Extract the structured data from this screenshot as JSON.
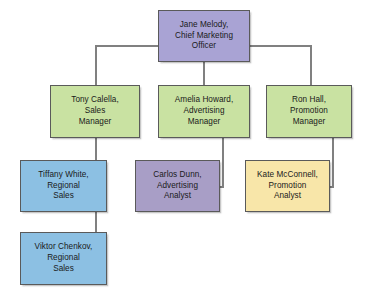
{
  "diagram": {
    "type": "organization-chart",
    "canvas": {
      "width": 376,
      "height": 302,
      "background": "#ffffff"
    },
    "connector_color": "#808080",
    "connector_width": 2,
    "palette": {
      "executive_purple": "#a9a3d4",
      "manager_green": "#c9e2a2",
      "regional_blue": "#8cc0e3",
      "analyst_purple": "#a89ec6",
      "analyst_yellow": "#f8e6a9",
      "border": "#5a5a5a"
    },
    "nodes": [
      {
        "id": "jane-melody",
        "name": "Jane Melody",
        "role": "Chief Marketing Officer",
        "lines": [
          "Jane Melody,",
          "Chief Marketing",
          "Officer"
        ],
        "level": 1,
        "fill": "#a9a3d4",
        "x": 158,
        "y": 10,
        "w": 92,
        "h": 52
      },
      {
        "id": "tony-calella",
        "name": "Tony Calella",
        "role": "Sales Manager",
        "lines": [
          "Tony Calella,",
          "Sales",
          "Manager"
        ],
        "level": 2,
        "fill": "#c9e2a2",
        "x": 50,
        "y": 85,
        "w": 90,
        "h": 53
      },
      {
        "id": "amelia-howard",
        "name": "Amelia Howard",
        "role": "Advertising Manager",
        "lines": [
          "Amelia Howard,",
          "Advertising",
          "Manager"
        ],
        "level": 2,
        "fill": "#c9e2a2",
        "x": 158,
        "y": 85,
        "w": 92,
        "h": 53
      },
      {
        "id": "ron-hall",
        "name": "Ron Hall",
        "role": "Promotion Manager",
        "lines": [
          "Ron Hall,",
          "Promotion",
          "Manager"
        ],
        "level": 2,
        "fill": "#c9e2a2",
        "x": 266,
        "y": 85,
        "w": 86,
        "h": 53
      },
      {
        "id": "tiffany-white",
        "name": "Tiffany White",
        "role": "Regional Sales",
        "lines": [
          "Tiffany White,",
          "Regional",
          "Sales"
        ],
        "level": 3,
        "fill": "#8cc0e3",
        "x": 20,
        "y": 160,
        "w": 87,
        "h": 52
      },
      {
        "id": "carlos-dunn",
        "name": "Carlos Dunn",
        "role": "Advertising Analyst",
        "lines": [
          "Carlos Dunn,",
          "Advertising",
          "Analyst"
        ],
        "level": 3,
        "fill": "#a89ec6",
        "x": 135,
        "y": 160,
        "w": 85,
        "h": 52
      },
      {
        "id": "kate-mcconnell",
        "name": "Kate McConnell",
        "role": "Promotion Analyst",
        "lines": [
          "Kate McConnell,",
          "Promotion",
          "Analyst"
        ],
        "level": 3,
        "fill": "#f8e6a9",
        "x": 245,
        "y": 160,
        "w": 85,
        "h": 52
      },
      {
        "id": "viktor-chenkov",
        "name": "Viktor Chenkov",
        "role": "Regional Sales",
        "lines": [
          "Viktor Chenkov,",
          "Regional",
          "Sales"
        ],
        "level": 4,
        "fill": "#8cc0e3",
        "x": 20,
        "y": 232,
        "w": 87,
        "h": 53
      }
    ],
    "edges": [
      {
        "from": "jane-melody",
        "to": "tony-calella"
      },
      {
        "from": "jane-melody",
        "to": "amelia-howard"
      },
      {
        "from": "jane-melody",
        "to": "ron-hall"
      },
      {
        "from": "tony-calella",
        "to": "tiffany-white"
      },
      {
        "from": "tony-calella",
        "to": "viktor-chenkov"
      },
      {
        "from": "amelia-howard",
        "to": "carlos-dunn"
      },
      {
        "from": "ron-hall",
        "to": "kate-mcconnell"
      }
    ]
  }
}
